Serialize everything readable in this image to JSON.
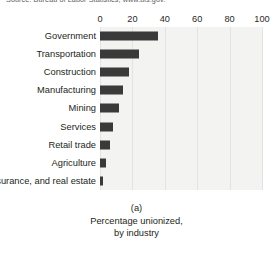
{
  "source_note": "Source: Bureau of Labor Statistics, www.bls.gov.",
  "caption": {
    "panel_letter": "(a)",
    "line1": "Percentage unionized,",
    "line2": "by industry"
  },
  "chart_data": {
    "type": "bar",
    "orientation": "horizontal",
    "title": "",
    "subtitle": "",
    "xlabel": "",
    "ylabel": "",
    "xlim": [
      0,
      100
    ],
    "ylim": null,
    "grid": true,
    "legend": null,
    "tick_labels": [
      "0",
      "20",
      "40",
      "60",
      "80",
      "100"
    ],
    "ticks": [
      0,
      20,
      40,
      60,
      80,
      100
    ],
    "categories": [
      "Government",
      "Transportation",
      "Construction",
      "Manufacturing",
      "Mining",
      "Services",
      "Retail trade",
      "Agriculture",
      "Finance, insurance, and real estate"
    ],
    "values": [
      36,
      24,
      18,
      14,
      12,
      8,
      6,
      4,
      2
    ],
    "bar_color": "#3a3a3a",
    "plot_background": "#f3f3f2"
  },
  "rows": [
    {
      "label": "Government",
      "value": 36,
      "two_line": false
    },
    {
      "label": "Transportation",
      "value": 24,
      "two_line": false
    },
    {
      "label": "Construction",
      "value": 18,
      "two_line": false
    },
    {
      "label": "Manufacturing",
      "value": 14,
      "two_line": false
    },
    {
      "label": "Mining",
      "value": 12,
      "two_line": false
    },
    {
      "label": "Services",
      "value": 8,
      "two_line": false
    },
    {
      "label": "Retail trade",
      "value": 6,
      "two_line": false
    },
    {
      "label": "Agriculture",
      "value": 4,
      "two_line": false
    },
    {
      "label": "Finance, insurance, and real estate",
      "value": 2,
      "two_line": true
    }
  ]
}
